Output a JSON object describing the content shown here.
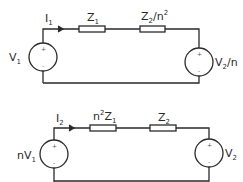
{
  "circuit1": {
    "current": {
      "main": "I",
      "sub": "1"
    },
    "z_left": {
      "main": "Z",
      "sub": "1"
    },
    "z_right": {
      "main": "Z",
      "sub": "2",
      "rest": "/n",
      "sup": "2"
    },
    "source_left": {
      "main": "V",
      "sub": "1"
    },
    "source_right": {
      "main": "V",
      "sub": "2",
      "rest": "/n"
    },
    "plus": "+",
    "minus": "-"
  },
  "circuit2": {
    "current": {
      "main": "I",
      "sub": "2"
    },
    "z_left": {
      "pre": "n",
      "sup": "2",
      "main": "Z",
      "sub": "1"
    },
    "z_right": {
      "main": "Z",
      "sub": "2"
    },
    "source_left": {
      "pre": "nV",
      "sub": "1"
    },
    "source_right": {
      "main": "V",
      "sub": "2"
    },
    "plus": "+",
    "minus": "-"
  },
  "colors": {
    "wire": "#2a2a2a",
    "background": "#ffffff"
  }
}
